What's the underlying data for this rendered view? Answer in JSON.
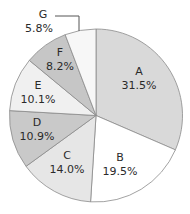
{
  "chart_data": {
    "type": "pie",
    "title": "",
    "start_angle": "12 o'clock",
    "direction": "clockwise",
    "categories": [
      "A",
      "B",
      "C",
      "D",
      "E",
      "F",
      "G"
    ],
    "values": [
      31.5,
      19.5,
      14.0,
      10.9,
      10.1,
      8.2,
      5.8
    ],
    "labels": [
      "31.5%",
      "19.5%",
      "14.0%",
      "10.9%",
      "10.1%",
      "8.2%",
      "5.8%"
    ],
    "colors": [
      "#d9d9d9",
      "#ffffff",
      "#e6e6e6",
      "#c9c9c9",
      "#f0f0f0",
      "#c6c6c6",
      "#f7f7f7"
    ],
    "legend": "none",
    "annotations": [
      {
        "slice": "G",
        "type": "leader-line",
        "label_position": "outside top-left"
      }
    ]
  },
  "style": {
    "edge_color": "#8a8a8a",
    "text_color": "#2a2a2a"
  }
}
